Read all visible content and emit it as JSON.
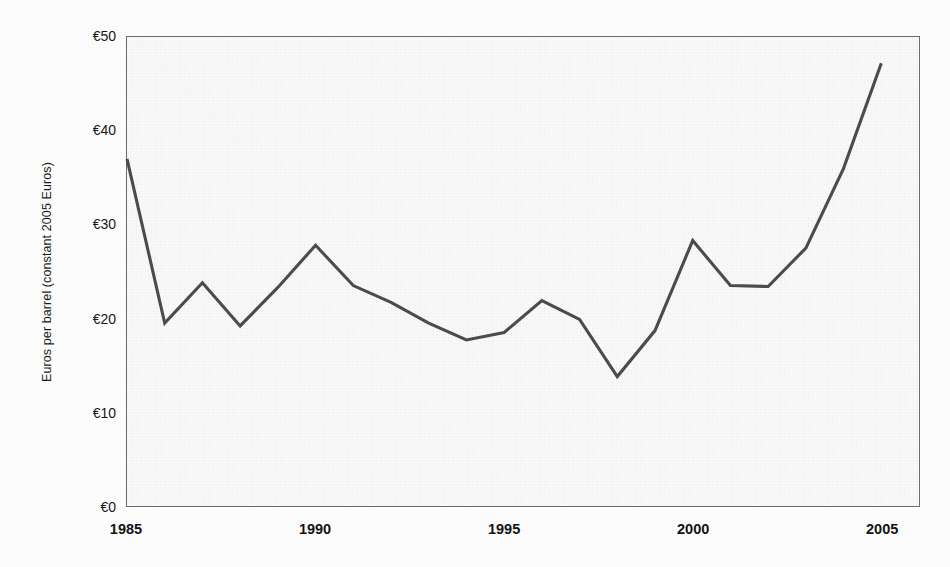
{
  "chart_data": {
    "type": "line",
    "title": "",
    "subtitle": "",
    "xlabel": "",
    "ylabel": "Euros per barrel (constant 2005 Euros)",
    "grid": false,
    "legend": null,
    "x": [
      1985,
      1986,
      1987,
      1988,
      1989,
      1990,
      1991,
      1992,
      1993,
      1994,
      1995,
      1996,
      1997,
      1998,
      1999,
      2000,
      2001,
      2002,
      2003,
      2004,
      2005
    ],
    "values": [
      37.0,
      19.5,
      23.8,
      19.2,
      23.3,
      27.8,
      23.5,
      21.7,
      19.5,
      17.7,
      18.5,
      21.9,
      19.9,
      13.8,
      18.7,
      28.3,
      23.5,
      23.4,
      27.5,
      36.0,
      47.2
    ],
    "series": [
      {
        "name": "Crude oil price",
        "values": [
          37.0,
          19.5,
          23.8,
          19.2,
          23.3,
          27.8,
          23.5,
          21.7,
          19.5,
          17.7,
          18.5,
          21.9,
          19.9,
          13.8,
          18.7,
          28.3,
          23.5,
          23.4,
          27.5,
          36.0,
          47.2
        ],
        "color": "#4d4d4d"
      }
    ],
    "xlim": [
      1985,
      2006
    ],
    "ylim": [
      0,
      50
    ],
    "y_ticks": [
      0,
      10,
      20,
      30,
      40,
      50
    ],
    "y_tick_labels": [
      "€0",
      "€10",
      "€20",
      "€30",
      "€40",
      "€50"
    ],
    "x_ticks": [
      1985,
      1990,
      1995,
      2000,
      2005
    ],
    "x_tick_labels": [
      "1985",
      "1990",
      "1995",
      "2000",
      "2005"
    ],
    "currency_symbol": "€",
    "line_color": "#4d4d4d",
    "plot_background": "#fbfbfb",
    "axis_color": "#6d6d6d"
  }
}
